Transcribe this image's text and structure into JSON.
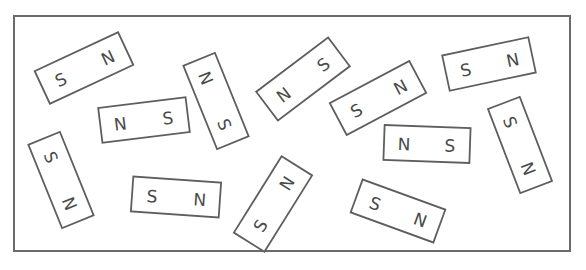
{
  "diagram": {
    "title": "",
    "frame": {
      "x": 14,
      "y": 16,
      "width": 556,
      "height": 235,
      "stroke": "#6b6b6b"
    },
    "magnet_stroke": "#5e5e5e",
    "label_color": "#4a4a4a",
    "magnets": [
      {
        "id": "m1",
        "cx": 84,
        "cy": 68,
        "w": 92,
        "h": 36,
        "rot": -25,
        "left": "S",
        "right": "N"
      },
      {
        "id": "m2",
        "cx": 144,
        "cy": 120,
        "w": 88,
        "h": 35,
        "rot": -7,
        "left": "N",
        "right": "S"
      },
      {
        "id": "m3",
        "cx": 216,
        "cy": 101,
        "w": 90,
        "h": 34,
        "rot": 68,
        "left": "N",
        "right": "S"
      },
      {
        "id": "m4",
        "cx": 303,
        "cy": 79,
        "w": 90,
        "h": 36,
        "rot": -37,
        "left": "N",
        "right": "S"
      },
      {
        "id": "m5",
        "cx": 378,
        "cy": 98,
        "w": 90,
        "h": 36,
        "rot": -28,
        "left": "S",
        "right": "N"
      },
      {
        "id": "m6",
        "cx": 489,
        "cy": 64,
        "w": 88,
        "h": 36,
        "rot": -12,
        "left": "S",
        "right": "N"
      },
      {
        "id": "m7",
        "cx": 427,
        "cy": 144,
        "w": 86,
        "h": 35,
        "rot": 2,
        "left": "N",
        "right": "S"
      },
      {
        "id": "m8",
        "cx": 520,
        "cy": 145,
        "w": 90,
        "h": 34,
        "rot": 69,
        "left": "S",
        "right": "N"
      },
      {
        "id": "m9",
        "cx": 61,
        "cy": 180,
        "w": 90,
        "h": 34,
        "rot": 68,
        "left": "S",
        "right": "N"
      },
      {
        "id": "m10",
        "cx": 176,
        "cy": 197,
        "w": 88,
        "h": 35,
        "rot": 4,
        "left": "S",
        "right": "N"
      },
      {
        "id": "m11",
        "cx": 273,
        "cy": 204,
        "w": 90,
        "h": 36,
        "rot": -58,
        "left": "S",
        "right": "N"
      },
      {
        "id": "m12",
        "cx": 398,
        "cy": 211,
        "w": 88,
        "h": 35,
        "rot": 20,
        "left": "S",
        "right": "N"
      }
    ]
  }
}
